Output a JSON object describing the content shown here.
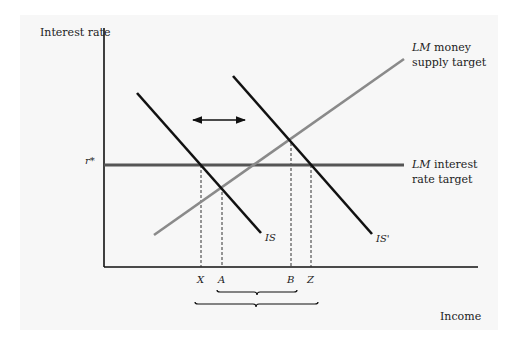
{
  "diagram": {
    "type": "IS-LM",
    "axes": {
      "y_label": "Interest rate",
      "x_label": "Income",
      "y_tick_label": "r*"
    },
    "curves": {
      "is": {
        "label": "IS",
        "color": "#111111"
      },
      "is_prime": {
        "label": "IS'",
        "color": "#111111"
      },
      "lm_money": {
        "label_italic": "LM",
        "label_rest": " money",
        "label_line2": "supply target",
        "color": "#8a8a8a"
      },
      "lm_rate": {
        "label_italic": "LM",
        "label_rest": " interest",
        "label_line2": "rate target",
        "color": "#555555"
      }
    },
    "x_points": [
      "X",
      "A",
      "B",
      "Z"
    ],
    "annotations": {
      "shift_arrow": "double-headed horizontal arrow indicating IS shifts",
      "inner_brace": "range A to B",
      "outer_brace": "range X to Z"
    }
  }
}
